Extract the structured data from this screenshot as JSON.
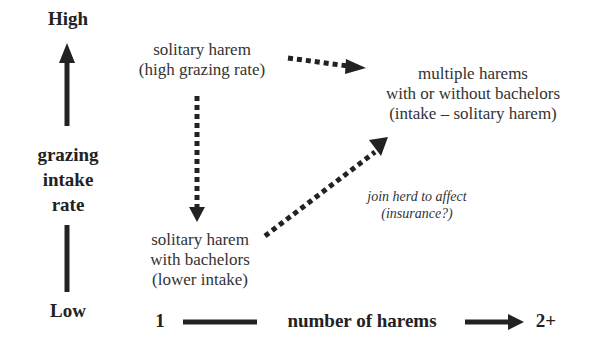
{
  "y_axis": {
    "top_label": "High",
    "bottom_label": "Low",
    "title_lines": [
      "grazing",
      "intake",
      "rate"
    ]
  },
  "x_axis": {
    "left_label": "1",
    "title": "number of harems",
    "right_label": "2+"
  },
  "nodes": {
    "solitary_high": {
      "line1": "solitary harem",
      "line2": "(high grazing rate)"
    },
    "multiple": {
      "line1": "multiple harems",
      "line2": "with or without bachelors",
      "line3": "(intake – solitary harem)"
    },
    "solitary_bachelors": {
      "line1": "solitary harem",
      "line2": "with bachelors",
      "line3": "(lower intake)"
    }
  },
  "annotation": {
    "line1": "join herd to affect",
    "line2": "(insurance?)"
  },
  "colors": {
    "ink": "#222222",
    "background": "#ffffff"
  }
}
